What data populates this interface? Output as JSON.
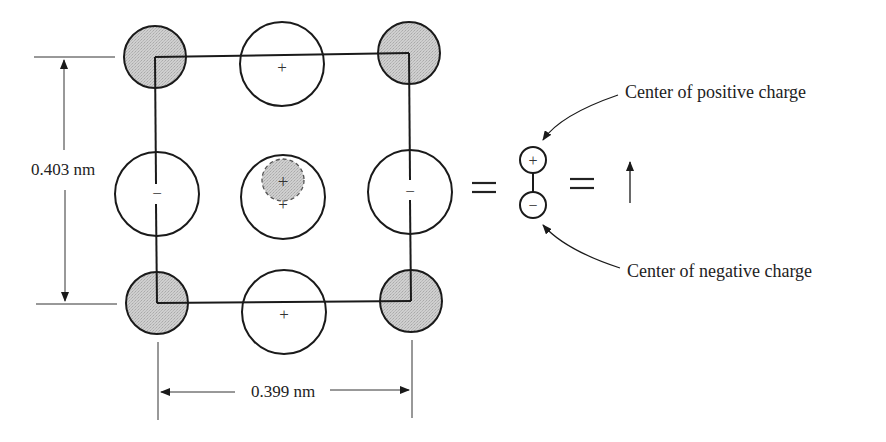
{
  "diagram": {
    "type": "crystal-unit-cell-dipole",
    "dimensions": {
      "vertical": "0.403 nm",
      "horizontal": "0.399 nm"
    },
    "atoms": [
      {
        "id": "corner-top-left",
        "kind": "shaded",
        "cx": 155,
        "cy": 57,
        "r": 31,
        "label": ""
      },
      {
        "id": "edge-top",
        "kind": "open",
        "cx": 282,
        "cy": 64,
        "r": 42,
        "label": "+"
      },
      {
        "id": "corner-top-right",
        "kind": "shaded",
        "cx": 409,
        "cy": 53,
        "r": 31,
        "label": ""
      },
      {
        "id": "edge-left",
        "kind": "open",
        "cx": 157,
        "cy": 194,
        "r": 42,
        "label": "−"
      },
      {
        "id": "center",
        "kind": "open-with-displaced",
        "cx": 283,
        "cy": 194,
        "r": 42,
        "label": "+"
      },
      {
        "id": "edge-right",
        "kind": "open",
        "cx": 410,
        "cy": 192,
        "r": 42,
        "label": "−"
      },
      {
        "id": "corner-bottom-left",
        "kind": "shaded",
        "cx": 157,
        "cy": 303,
        "r": 31,
        "label": ""
      },
      {
        "id": "edge-bottom",
        "kind": "open",
        "cx": 284,
        "cy": 312,
        "r": 42,
        "label": "+"
      },
      {
        "id": "corner-bottom-right",
        "kind": "shaded",
        "cx": 411,
        "cy": 301,
        "r": 31,
        "label": ""
      }
    ],
    "displaced_ion": {
      "cx": 283,
      "cy": 180,
      "r": 21,
      "label": "+"
    },
    "equals_signs": [
      "=",
      "="
    ],
    "dipole": {
      "positive_symbol": "+",
      "negative_symbol": "−"
    },
    "annotations": {
      "positive": "Center of positive charge",
      "negative": "Center of negative charge"
    },
    "colors": {
      "shaded_fill": "#c8c8c8",
      "stroke": "#1a1a1a",
      "text": "#222222"
    }
  }
}
